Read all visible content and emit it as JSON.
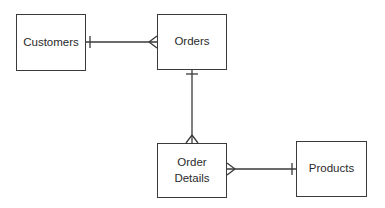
{
  "diagram": {
    "type": "entity-relationship",
    "notation": "crow's foot",
    "entities": [
      {
        "id": "customers",
        "label": "Customers"
      },
      {
        "id": "orders",
        "label": "Orders"
      },
      {
        "id": "order_details",
        "label": "Order\nDetails"
      },
      {
        "id": "products",
        "label": "Products"
      }
    ],
    "relationships": [
      {
        "from": "customers",
        "to": "orders",
        "from_cardinality": "one",
        "to_cardinality": "many"
      },
      {
        "from": "orders",
        "to": "order_details",
        "from_cardinality": "one",
        "to_cardinality": "many"
      },
      {
        "from": "products",
        "to": "order_details",
        "from_cardinality": "one",
        "to_cardinality": "many"
      }
    ],
    "colors": {
      "line": "#3a3a3a",
      "background": "#ffffff",
      "text": "#2a2a2a"
    }
  }
}
